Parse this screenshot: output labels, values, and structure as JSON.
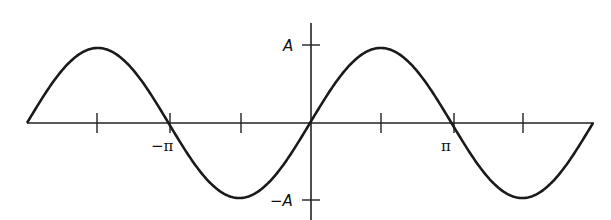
{
  "chart_data": {
    "type": "line",
    "title": "",
    "xlabel": "",
    "ylabel": "",
    "function": "y = A sin(x)",
    "x_range": [
      "-2π",
      "2π"
    ],
    "xlim": [
      -6.2832,
      6.2832
    ],
    "ylim": [
      -1,
      1
    ],
    "x_tick_labels": [
      {
        "value": -3.1416,
        "label": "−π"
      },
      {
        "value": 3.1416,
        "label": "π"
      }
    ],
    "x_ticks_unlabeled": [
      -4.7124,
      -1.5708,
      1.5708,
      4.7124
    ],
    "y_tick_labels": [
      {
        "value": 1,
        "label": "A"
      },
      {
        "value": -1,
        "label": "−A"
      }
    ],
    "series": [
      {
        "name": "A sin(x)",
        "x": [
          -6.2832,
          -4.7124,
          -3.1416,
          -1.5708,
          0,
          1.5708,
          3.1416,
          4.7124,
          6.2832
        ],
        "y": [
          0,
          1,
          0,
          -1,
          0,
          1,
          0,
          -1,
          0
        ]
      }
    ],
    "grid": false,
    "legend": null
  },
  "labels": {
    "A": "A",
    "negA": "−A",
    "negPi": "−π",
    "pi": "π"
  }
}
